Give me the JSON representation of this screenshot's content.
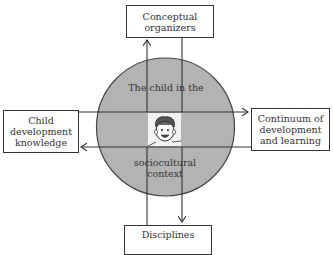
{
  "diagram": {
    "center": {
      "label_top": "The child in the",
      "label_bottom_line1": "sociocultural",
      "label_bottom_line2": "context",
      "image": "child-face-drawing",
      "fill_color": "#b3b3b3"
    },
    "boxes": {
      "top": {
        "line1": "Conceptual",
        "line2": "organizers"
      },
      "left": {
        "line1": "Child",
        "line2": "development",
        "line3": "knowledge"
      },
      "right": {
        "line1": "Continuum of",
        "line2": "development",
        "line3": "and learning"
      },
      "bottom": {
        "line1": "Disciplines"
      }
    },
    "arrows": [
      {
        "from": "center",
        "to": "top",
        "direction": "up"
      },
      {
        "from": "top",
        "to": "center",
        "direction": "none"
      },
      {
        "from": "left",
        "to": "right",
        "direction": "right"
      },
      {
        "from": "right",
        "to": "left",
        "direction": "left"
      },
      {
        "from": "center",
        "to": "bottom",
        "direction": "down"
      },
      {
        "from": "bottom",
        "to": "center",
        "direction": "none"
      }
    ],
    "line_color": "#333333"
  }
}
